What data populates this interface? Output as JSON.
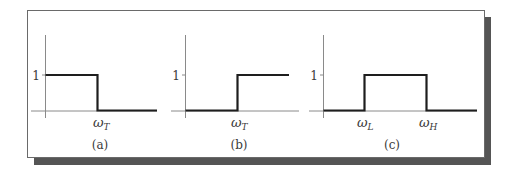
{
  "figure": {
    "frame": {
      "border_color": "#6a6a6a",
      "shadow_color": "#555555",
      "background": "#ffffff"
    },
    "line_colors": {
      "signal": "#1e1e1e",
      "axis": "#8a8a8a"
    },
    "panels": [
      {
        "id": "a",
        "caption": "(a)",
        "type": "low-pass ideal filter response",
        "y_tick_label": "1",
        "x_markers": [
          {
            "symbol": "ω",
            "subscript": "T"
          }
        ]
      },
      {
        "id": "b",
        "caption": "(b)",
        "type": "high-pass ideal filter response",
        "y_tick_label": "1",
        "x_markers": [
          {
            "symbol": "ω",
            "subscript": "T"
          }
        ]
      },
      {
        "id": "c",
        "caption": "(c)",
        "type": "band-pass ideal filter response",
        "y_tick_label": "1",
        "x_markers": [
          {
            "symbol": "ω",
            "subscript": "L"
          },
          {
            "symbol": "ω",
            "subscript": "H"
          }
        ]
      }
    ]
  }
}
